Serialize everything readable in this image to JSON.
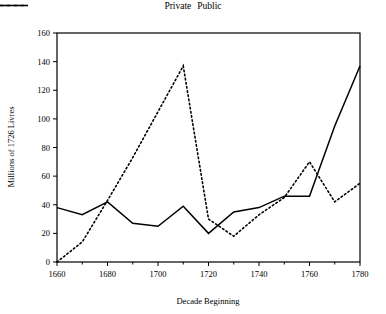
{
  "legend": {
    "position": "top-center",
    "items": [
      {
        "label": "Private",
        "style": "solid",
        "icon": "solid-line-icon"
      },
      {
        "label": "Public",
        "style": "dotted",
        "icon": "dotted-line-icon"
      }
    ]
  },
  "chart_data": {
    "type": "line",
    "title": "",
    "xlabel": "Decade Beginning",
    "ylabel": "Millions of 1726 Livres",
    "x": [
      1660,
      1670,
      1680,
      1690,
      1700,
      1710,
      1720,
      1730,
      1740,
      1750,
      1760,
      1770,
      1780
    ],
    "xlim": [
      1660,
      1780
    ],
    "ylim": [
      0,
      160
    ],
    "grid": false,
    "xticks": [
      1660,
      1680,
      1700,
      1720,
      1740,
      1760,
      1780
    ],
    "xtick_labels": [
      "1660",
      "1680",
      "1700",
      "1720",
      "1740",
      "1760",
      "1780"
    ],
    "xminorticks": [
      1670,
      1690,
      1710,
      1730,
      1750,
      1770
    ],
    "yticks": [
      0,
      20,
      40,
      60,
      80,
      100,
      120,
      140,
      160
    ],
    "ytick_labels": [
      "0",
      "20",
      "40",
      "60",
      "80",
      "100",
      "120",
      "140",
      "160"
    ],
    "series": [
      {
        "name": "Private",
        "style": "solid",
        "color": "#000000",
        "values": [
          38,
          33,
          42,
          27,
          25,
          39,
          20,
          35,
          38,
          46,
          46,
          95,
          137
        ]
      },
      {
        "name": "Public",
        "style": "dotted",
        "color": "#000000",
        "values": [
          0,
          14,
          43,
          73,
          105,
          137,
          30,
          18,
          33,
          45,
          70,
          42,
          55
        ]
      }
    ]
  }
}
